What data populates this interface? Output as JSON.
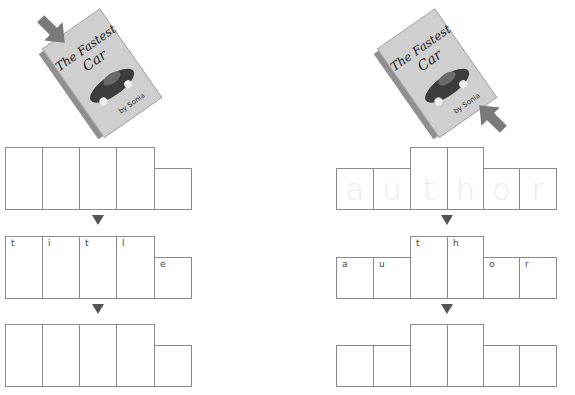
{
  "left_panel": {
    "book": {
      "title_line1": "The Fastest",
      "title_line2": "Car",
      "author": "by Sonia",
      "pointer": "top-left (title)"
    },
    "word": "title",
    "row1": {
      "letters": [
        "",
        "",
        "",
        "",
        ""
      ],
      "shape": [
        "tall",
        "tall",
        "tall",
        "tall",
        "short"
      ]
    },
    "row2": {
      "letters": [
        "t",
        "i",
        "t",
        "l",
        "e"
      ],
      "shape": [
        "tall",
        "tall",
        "tall",
        "tall",
        "short"
      ]
    },
    "row3": {
      "letters": [
        "",
        "",
        "",
        "",
        ""
      ],
      "shape": [
        "tall",
        "tall",
        "tall",
        "tall",
        "short"
      ]
    }
  },
  "right_panel": {
    "book": {
      "title_line1": "The Fastest",
      "title_line2": "Car",
      "author": "by Sonia",
      "pointer": "bottom-right (author)"
    },
    "word": "author",
    "row1": {
      "trace_letters": [
        "a",
        "u",
        "t",
        "h",
        "o",
        "r"
      ],
      "shape": [
        "short",
        "short",
        "tall",
        "tall",
        "short",
        "short"
      ]
    },
    "row2": {
      "letters": [
        "a",
        "u",
        "t",
        "h",
        "o",
        "r"
      ],
      "shape": [
        "short",
        "short",
        "tall",
        "tall",
        "short",
        "short"
      ]
    },
    "row3": {
      "letters": [
        "",
        "",
        "",
        "",
        "",
        ""
      ],
      "shape": [
        "short",
        "short",
        "tall",
        "tall",
        "short",
        "short"
      ]
    }
  },
  "colors": {
    "box_border": "#8a8a8a",
    "arrow": "#555555",
    "pointer_arrow": "#7a7a7a",
    "book_cover": "#c9c9c9"
  }
}
